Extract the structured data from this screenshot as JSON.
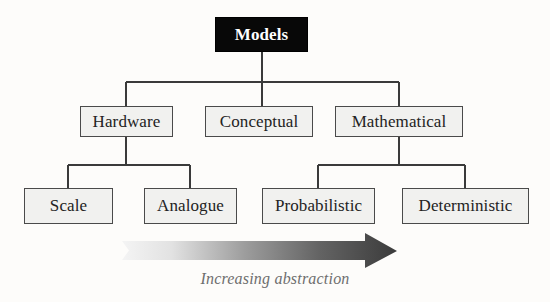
{
  "diagram": {
    "title_node": {
      "label": "Models",
      "fill": "#080808",
      "text_color": "#ffffff"
    },
    "background_color": "#fdfcfa",
    "box_fill": "#f1f1ef",
    "box_border_color": "#4a4a4a",
    "connector_color": "#3a3a3a",
    "levels": [
      {
        "name": "root",
        "nodes": [
          {
            "id": "models",
            "label": "Models"
          }
        ]
      },
      {
        "name": "model-types",
        "nodes": [
          {
            "id": "hardware",
            "label": "Hardware"
          },
          {
            "id": "conceptual",
            "label": "Conceptual"
          },
          {
            "id": "mathematical",
            "label": "Mathematical"
          }
        ]
      },
      {
        "name": "model-subtypes",
        "nodes": [
          {
            "id": "scale",
            "label": "Scale"
          },
          {
            "id": "analogue",
            "label": "Analogue"
          },
          {
            "id": "probabilistic",
            "label": "Probabilistic"
          },
          {
            "id": "deterministic",
            "label": "Deterministic"
          }
        ]
      }
    ],
    "edges": [
      {
        "from": "models",
        "to": "hardware"
      },
      {
        "from": "models",
        "to": "conceptual"
      },
      {
        "from": "models",
        "to": "mathematical"
      },
      {
        "from": "hardware",
        "to": "scale"
      },
      {
        "from": "hardware",
        "to": "analogue"
      },
      {
        "from": "mathematical",
        "to": "probabilistic"
      },
      {
        "from": "mathematical",
        "to": "deterministic"
      }
    ],
    "annotation": {
      "arrow_label": "Increasing abstraction",
      "arrow_direction": "left-to-right",
      "arrow_gradient_start": "#f0f0f0",
      "arrow_gradient_end": "#3d3d3d",
      "arrow_label_color": "#6e6e6e"
    }
  }
}
